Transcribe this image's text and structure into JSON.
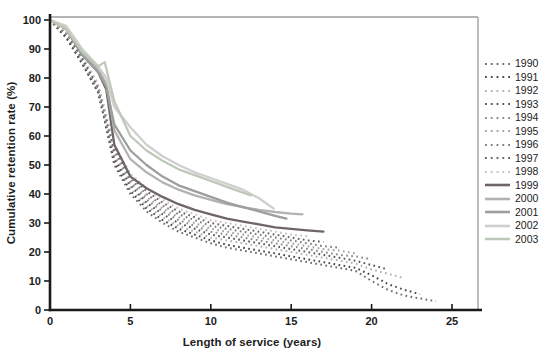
{
  "palette": {
    "axis": "#1a1a1a",
    "frame": "#9b9b9b",
    "tick_text": "#1c1c1c",
    "background": "#ffffff"
  },
  "chart_data": {
    "type": "line",
    "title": "",
    "xlabel": "Length of service (years)",
    "ylabel": "Cumulative retention rate (%)",
    "xlim": [
      0,
      25
    ],
    "ylim": [
      0,
      100
    ],
    "xticks": [
      0,
      5,
      10,
      15,
      20,
      25
    ],
    "yticks": [
      0,
      10,
      20,
      30,
      40,
      50,
      60,
      70,
      80,
      90,
      100
    ],
    "grid": false,
    "legend_position": "right",
    "series": [
      {
        "name": "1990",
        "style": "dotted",
        "color": "#6e6e6e",
        "points": [
          [
            0,
            100
          ],
          [
            1,
            94
          ],
          [
            2,
            85
          ],
          [
            3,
            76
          ],
          [
            4,
            50
          ],
          [
            5,
            40
          ],
          [
            6,
            34
          ],
          [
            7,
            30
          ],
          [
            8,
            27
          ],
          [
            9,
            25
          ],
          [
            10,
            23
          ],
          [
            11,
            21.5
          ],
          [
            12,
            20.5
          ],
          [
            13,
            19.5
          ],
          [
            14,
            18.5
          ],
          [
            15,
            17.5
          ],
          [
            16,
            16.5
          ],
          [
            17,
            15.5
          ],
          [
            18,
            14.5
          ],
          [
            19,
            13.5
          ],
          [
            20,
            10
          ],
          [
            21,
            7
          ],
          [
            22,
            5
          ],
          [
            23,
            4
          ],
          [
            24,
            3
          ]
        ]
      },
      {
        "name": "1991",
        "style": "dotted",
        "color": "#4c4647",
        "points": [
          [
            0,
            100
          ],
          [
            1,
            94
          ],
          [
            2,
            85
          ],
          [
            3,
            75
          ],
          [
            4,
            51
          ],
          [
            5,
            41
          ],
          [
            6,
            35
          ],
          [
            7,
            31
          ],
          [
            8,
            28
          ],
          [
            9,
            26
          ],
          [
            10,
            24
          ],
          [
            11,
            22.5
          ],
          [
            12,
            21.5
          ],
          [
            13,
            20.5
          ],
          [
            14,
            19.5
          ],
          [
            15,
            18.5
          ],
          [
            16,
            17.5
          ],
          [
            17,
            16.5
          ],
          [
            18,
            15.5
          ],
          [
            19,
            14.5
          ],
          [
            20,
            12
          ],
          [
            21,
            9
          ],
          [
            22,
            7
          ],
          [
            23,
            5.5
          ]
        ]
      },
      {
        "name": "1992",
        "style": "dotted",
        "color": "#b0b0b0",
        "points": [
          [
            0,
            100
          ],
          [
            1,
            95
          ],
          [
            2,
            86
          ],
          [
            3,
            76
          ],
          [
            4,
            52
          ],
          [
            5,
            42
          ],
          [
            6,
            36
          ],
          [
            7,
            32
          ],
          [
            8,
            29
          ],
          [
            9,
            27
          ],
          [
            10,
            25
          ],
          [
            11,
            24
          ],
          [
            12,
            23
          ],
          [
            13,
            22
          ],
          [
            14,
            21
          ],
          [
            15,
            20
          ],
          [
            16,
            19
          ],
          [
            17,
            18
          ],
          [
            18,
            17
          ],
          [
            19,
            16
          ],
          [
            20,
            14
          ],
          [
            21,
            12.5
          ],
          [
            22,
            11
          ]
        ]
      },
      {
        "name": "1993",
        "style": "dotted",
        "color": "#565656",
        "points": [
          [
            0,
            100
          ],
          [
            1,
            95
          ],
          [
            2,
            85
          ],
          [
            3,
            75
          ],
          [
            4,
            52
          ],
          [
            5,
            43
          ],
          [
            6,
            37
          ],
          [
            7,
            33
          ],
          [
            8,
            30
          ],
          [
            9,
            28
          ],
          [
            10,
            26
          ],
          [
            11,
            25
          ],
          [
            12,
            24
          ],
          [
            13,
            23
          ],
          [
            14,
            22
          ],
          [
            15,
            21
          ],
          [
            16,
            20
          ],
          [
            17,
            19
          ],
          [
            18,
            18
          ],
          [
            19,
            17
          ],
          [
            20,
            15.5
          ],
          [
            21,
            14
          ]
        ]
      },
      {
        "name": "1994",
        "style": "dotted",
        "color": "#8a8a8a",
        "points": [
          [
            0,
            100
          ],
          [
            1,
            95
          ],
          [
            2,
            86
          ],
          [
            3,
            76
          ],
          [
            4,
            53
          ],
          [
            5,
            44
          ],
          [
            6,
            38
          ],
          [
            7,
            34
          ],
          [
            8,
            31
          ],
          [
            9,
            29
          ],
          [
            10,
            27
          ],
          [
            11,
            26
          ],
          [
            12,
            25
          ],
          [
            13,
            24
          ],
          [
            14,
            23
          ],
          [
            15,
            22
          ],
          [
            16,
            21
          ],
          [
            17,
            20
          ],
          [
            18,
            19
          ],
          [
            19,
            18.5
          ],
          [
            20,
            17.5
          ]
        ]
      },
      {
        "name": "1995",
        "style": "dotted",
        "color": "#a3a3a3",
        "points": [
          [
            0,
            100
          ],
          [
            1,
            96
          ],
          [
            2,
            86
          ],
          [
            3,
            76
          ],
          [
            4,
            54
          ],
          [
            5,
            44
          ],
          [
            6,
            39
          ],
          [
            7,
            35
          ],
          [
            8,
            32
          ],
          [
            9,
            30
          ],
          [
            10,
            28
          ],
          [
            11,
            27
          ],
          [
            12,
            26
          ],
          [
            13,
            25
          ],
          [
            14,
            24
          ],
          [
            15,
            23
          ],
          [
            16,
            22
          ],
          [
            17,
            21
          ],
          [
            18,
            20.5
          ],
          [
            19,
            19.5
          ]
        ]
      },
      {
        "name": "1996",
        "style": "dotted",
        "color": "#7d7d7d",
        "points": [
          [
            0,
            100
          ],
          [
            1,
            96
          ],
          [
            2,
            87
          ],
          [
            3,
            77
          ],
          [
            4,
            55
          ],
          [
            5,
            45
          ],
          [
            6,
            40
          ],
          [
            7,
            36
          ],
          [
            8,
            33
          ],
          [
            9,
            31
          ],
          [
            10,
            29
          ],
          [
            11,
            28
          ],
          [
            12,
            27
          ],
          [
            13,
            26
          ],
          [
            14,
            25
          ],
          [
            15,
            24
          ],
          [
            16,
            23
          ],
          [
            17,
            22
          ],
          [
            18,
            21.5
          ]
        ]
      },
      {
        "name": "1997",
        "style": "dotted",
        "color": "#666060",
        "points": [
          [
            0,
            100
          ],
          [
            1,
            96
          ],
          [
            2,
            87
          ],
          [
            3,
            77
          ],
          [
            4,
            56
          ],
          [
            5,
            46
          ],
          [
            6,
            41
          ],
          [
            7,
            37
          ],
          [
            8,
            34
          ],
          [
            9,
            32
          ],
          [
            10,
            30
          ],
          [
            11,
            29
          ],
          [
            12,
            28
          ],
          [
            13,
            27
          ],
          [
            14,
            26
          ],
          [
            15,
            25
          ],
          [
            16,
            24
          ],
          [
            17,
            23.5
          ]
        ]
      },
      {
        "name": "1998",
        "style": "dotted",
        "color": "#c2c2c2",
        "points": [
          [
            0,
            100
          ],
          [
            1,
            96
          ],
          [
            2,
            88
          ],
          [
            3,
            78
          ],
          [
            4,
            57
          ],
          [
            5,
            47
          ],
          [
            6,
            42
          ],
          [
            7,
            38
          ],
          [
            8,
            35
          ],
          [
            9,
            33
          ],
          [
            10,
            31
          ],
          [
            11,
            30
          ],
          [
            12,
            29
          ],
          [
            13,
            28
          ],
          [
            14,
            27
          ],
          [
            15,
            26
          ],
          [
            16,
            25.5
          ]
        ]
      },
      {
        "name": "1999",
        "style": "solid",
        "color": "#6f6466",
        "points": [
          [
            0,
            100
          ],
          [
            1,
            97
          ],
          [
            2,
            88
          ],
          [
            3,
            82
          ],
          [
            3.5,
            76
          ],
          [
            4,
            57
          ],
          [
            5,
            46
          ],
          [
            6,
            42
          ],
          [
            7,
            39
          ],
          [
            8,
            36.5
          ],
          [
            9,
            34.5
          ],
          [
            10,
            33
          ],
          [
            11,
            31.5
          ],
          [
            12,
            30.5
          ],
          [
            13,
            29.5
          ],
          [
            14,
            28.5
          ],
          [
            15,
            28
          ],
          [
            16,
            27.5
          ],
          [
            17,
            27
          ]
        ]
      },
      {
        "name": "2000",
        "style": "solid",
        "color": "#b3b3b3",
        "points": [
          [
            0,
            100
          ],
          [
            1,
            97
          ],
          [
            2,
            89
          ],
          [
            3,
            83
          ],
          [
            3.5,
            78
          ],
          [
            4,
            62
          ],
          [
            5,
            52
          ],
          [
            6,
            47.5
          ],
          [
            7,
            44
          ],
          [
            8,
            41.5
          ],
          [
            9,
            39.5
          ],
          [
            10,
            38
          ],
          [
            11,
            36.5
          ],
          [
            12,
            35.5
          ],
          [
            13,
            34.5
          ],
          [
            14,
            33.8
          ],
          [
            15,
            33.2
          ],
          [
            15.7,
            33
          ]
        ]
      },
      {
        "name": "2001",
        "style": "solid",
        "color": "#9c9f9a",
        "points": [
          [
            0,
            100
          ],
          [
            1,
            97
          ],
          [
            2,
            88
          ],
          [
            3,
            82
          ],
          [
            3.5,
            77
          ],
          [
            4,
            64
          ],
          [
            5,
            55
          ],
          [
            6,
            50
          ],
          [
            7,
            46
          ],
          [
            8,
            43
          ],
          [
            9,
            41
          ],
          [
            10,
            39
          ],
          [
            11,
            37
          ],
          [
            12,
            35.5
          ],
          [
            13,
            34
          ],
          [
            14,
            32.5
          ],
          [
            14.7,
            31.5
          ]
        ]
      },
      {
        "name": "2002",
        "style": "solid",
        "color": "#cfcfcf",
        "points": [
          [
            0,
            100
          ],
          [
            1,
            98
          ],
          [
            2,
            90
          ],
          [
            3,
            84
          ],
          [
            3.5,
            80
          ],
          [
            4,
            70
          ],
          [
            5,
            63
          ],
          [
            6,
            57
          ],
          [
            7,
            53
          ],
          [
            8,
            50
          ],
          [
            9,
            47.5
          ],
          [
            10,
            45.5
          ],
          [
            11,
            43.5
          ],
          [
            12,
            41.5
          ],
          [
            13,
            38.5
          ],
          [
            13.9,
            35
          ]
        ]
      },
      {
        "name": "2003",
        "style": "solid",
        "color": "#bec9b8",
        "points": [
          [
            0,
            100
          ],
          [
            1,
            97
          ],
          [
            2,
            89
          ],
          [
            3,
            84
          ],
          [
            3.4,
            85.5
          ],
          [
            4,
            72
          ],
          [
            5,
            60
          ],
          [
            6,
            55
          ],
          [
            7,
            51.5
          ],
          [
            8,
            48.5
          ],
          [
            9,
            46.5
          ],
          [
            10,
            44.5
          ],
          [
            11,
            42.5
          ],
          [
            12,
            40.5
          ],
          [
            12.5,
            39.5
          ]
        ]
      }
    ]
  }
}
